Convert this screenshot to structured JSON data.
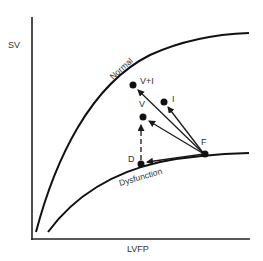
{
  "diagram": {
    "title": "",
    "y_axis_label": "SV",
    "x_axis_label": "LVFP",
    "curves": [
      {
        "name": "Normal",
        "label": "Normal"
      },
      {
        "name": "Dysfunction",
        "label": "Dysfunction"
      }
    ],
    "points": [
      {
        "id": "F",
        "label": "F"
      },
      {
        "id": "D",
        "label": "D"
      },
      {
        "id": "V",
        "label": "V"
      },
      {
        "id": "V+I",
        "label": "V+I"
      },
      {
        "id": "I",
        "label": "I"
      }
    ],
    "arrows": [
      {
        "from": "F",
        "to": "V+I",
        "style": "solid"
      },
      {
        "from": "F",
        "to": "V",
        "style": "solid"
      },
      {
        "from": "F",
        "to": "I",
        "style": "solid"
      },
      {
        "from": "F",
        "to": "D",
        "style": "solid"
      },
      {
        "from": "D",
        "to": "V",
        "style": "dashed"
      }
    ],
    "colors": {
      "line": "#1a1a1a",
      "text": "#333333"
    }
  }
}
